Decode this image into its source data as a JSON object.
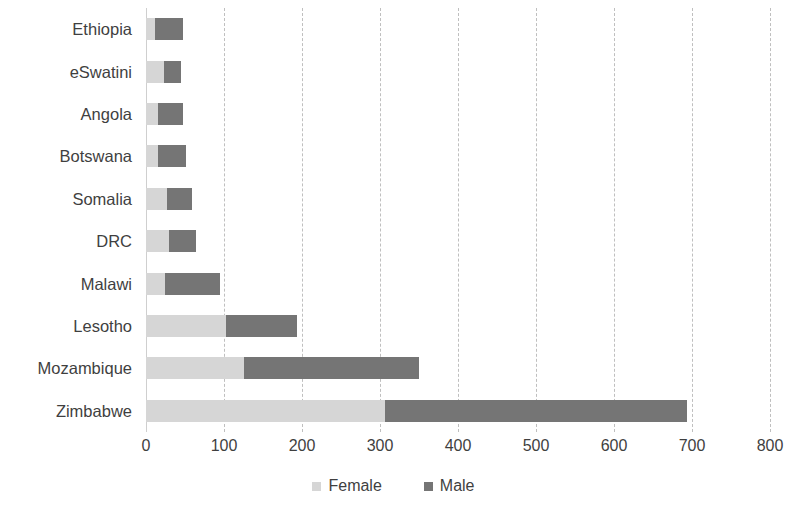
{
  "chart_data": {
    "type": "bar",
    "orientation": "horizontal",
    "stacked": true,
    "title": "",
    "subtitle": "",
    "xlabel": "",
    "ylabel": "",
    "xlim": [
      0,
      800
    ],
    "xticks": [
      0,
      100,
      200,
      300,
      400,
      500,
      600,
      700,
      800
    ],
    "xtick_labels": [
      "0",
      "100",
      "200",
      "300",
      "400",
      "500",
      "600",
      "700",
      "800"
    ],
    "grid": "vertical-dashed",
    "legend_position": "bottom-center",
    "categories": [
      "Ethiopia",
      "eSwatini",
      "Angola",
      "Botswana",
      "Somalia",
      "DRC",
      "Malawi",
      "Lesotho",
      "Mozambique",
      "Zimbabwe"
    ],
    "series": [
      {
        "name": "Female",
        "color": "#d6d6d6",
        "values": [
          11,
          23,
          16,
          16,
          27,
          30,
          24,
          103,
          126,
          306
        ]
      },
      {
        "name": "Male",
        "color": "#757575",
        "values": [
          36,
          22,
          31,
          35,
          32,
          34,
          71,
          91,
          224,
          388
        ]
      }
    ],
    "totals": [
      47,
      45,
      47,
      51,
      59,
      64,
      95,
      194,
      350,
      694
    ]
  },
  "legend": {
    "entries": [
      {
        "label": "Female",
        "color": "#d6d6d6"
      },
      {
        "label": "Male",
        "color": "#757575"
      }
    ]
  },
  "axis": {
    "grid_color": "#bfbfbf",
    "axis_color": "#cfcfcf",
    "text_color": "#3f3f3f"
  }
}
